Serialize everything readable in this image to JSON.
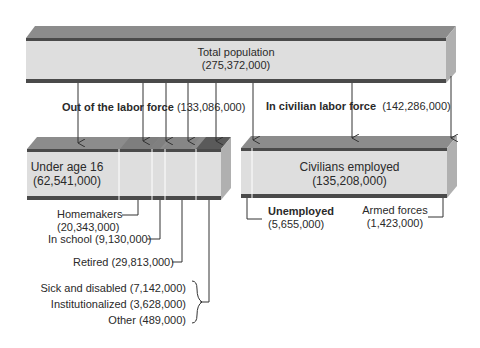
{
  "total": {
    "label": "Total population",
    "value": "(275,372,000)"
  },
  "out_of_labor_force": {
    "label": "Out of the labor force",
    "value": "(133,086,000)"
  },
  "in_civilian_labor_force": {
    "label": "In civilian labor force",
    "value": "(142,286,000)"
  },
  "under_16": {
    "label": "Under age 16",
    "value": "(62,541,000)"
  },
  "civilians_employed": {
    "label": "Civilians employed",
    "value": "(135,208,000)"
  },
  "homemakers": {
    "label": "Homemakers",
    "value": "(20,343,000)"
  },
  "in_school": {
    "label": "In school (9,130,000)"
  },
  "retired": {
    "label": "Retired (29,813,000)"
  },
  "sick": {
    "label": "Sick and disabled (7,142,000)"
  },
  "institutionalized": {
    "label": "Institutionalized (3,628,000)"
  },
  "other": {
    "label": "Other (489,000)"
  },
  "unemployed": {
    "label": "Unemployed",
    "value": "(5,655,000)"
  },
  "armed_forces": {
    "label": "Armed forces",
    "value": "(1,423,000)"
  },
  "colors": {
    "bar_face": "#dcdcdc",
    "bar_top": "#8a8a8a",
    "bar_edge": "#4a4a4a",
    "bar_side": "#b0b0b0",
    "line": "#333333"
  }
}
